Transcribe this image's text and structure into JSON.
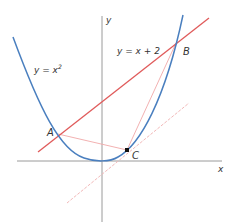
{
  "diagram": {
    "axes": {
      "x_label": "x",
      "y_label": "y"
    },
    "curves": [
      {
        "name": "parabola",
        "label_base": "y = x",
        "label_exp": "2",
        "color": "#4a7fbf"
      },
      {
        "name": "line",
        "label": "y = x + 2",
        "color": "#e05a5a"
      }
    ],
    "points": [
      {
        "name": "A",
        "label": "A"
      },
      {
        "name": "B",
        "label": "B"
      },
      {
        "name": "C",
        "label": "C"
      }
    ],
    "colors": {
      "axis": "#9a9a9a",
      "parabola": "#4a7fbf",
      "line": "#e05a5a",
      "chord": "#f0a8a8",
      "tangent": "#f2b8b8",
      "point": "#111111"
    }
  }
}
